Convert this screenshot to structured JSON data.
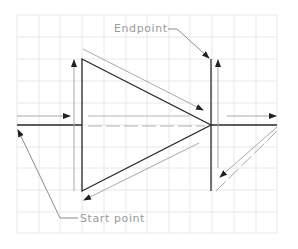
{
  "diagram": {
    "labels": {
      "endpoint": "Endpoint",
      "start_point": "Start point"
    },
    "colors": {
      "background": "#ffffff",
      "grid": "#e6e6e6",
      "primary_line": "#2a2a2a",
      "secondary_line": "#a8a8a8",
      "label_text": "#9a9a9a"
    },
    "grid": {
      "x_start": 17,
      "x_end": 277,
      "y_start": 15,
      "y_end": 233,
      "spacing": 21.7
    },
    "shape": "triangle with surrounding direction arrows"
  }
}
